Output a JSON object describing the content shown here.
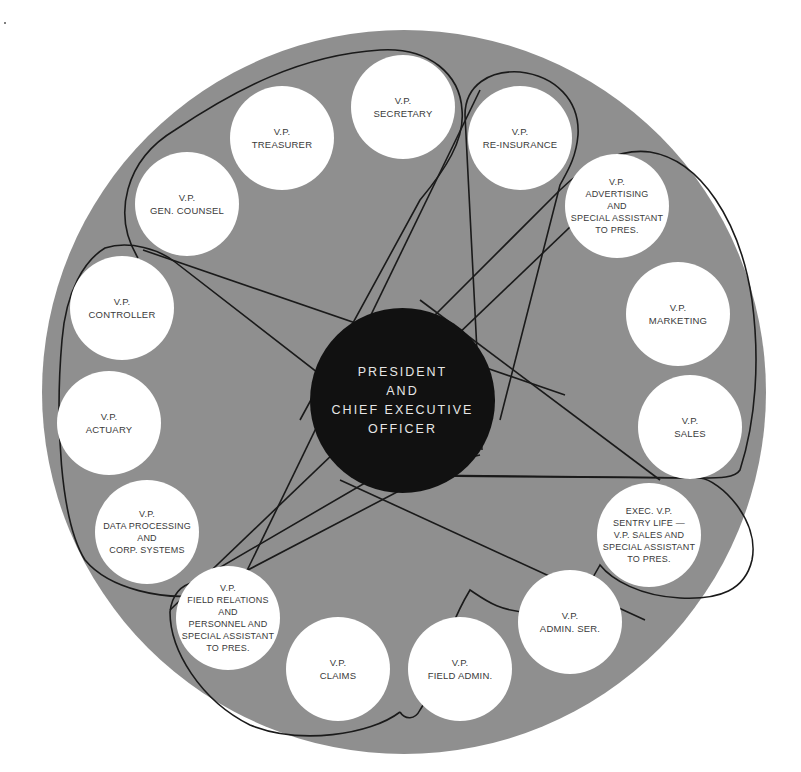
{
  "diagram": {
    "type": "circular organization chart",
    "colors": {
      "background": "#ffffff",
      "disk": "#8f8f8f",
      "vp_node": "#ffffff",
      "vp_text": "#3a3a3a",
      "center_node": "#111111",
      "center_text": "#e6e6e6",
      "connector_line": "#1a1a1a"
    },
    "center": {
      "label": "PRESIDENT\nAND\nCHIEF EXECUTIVE\nOFFICER"
    },
    "nodes": [
      {
        "id": "secretary",
        "label": "V.P.\nSECRETARY"
      },
      {
        "id": "re-insurance",
        "label": "V.P.\nRE-INSURANCE"
      },
      {
        "id": "advertising",
        "label": "V.P.\nADVERTISING\nAND\nSPECIAL ASSISTANT\nTO PRES."
      },
      {
        "id": "marketing",
        "label": "V.P.\nMARKETING"
      },
      {
        "id": "sales",
        "label": "V.P.\nSALES"
      },
      {
        "id": "exec-vp-sentry-life",
        "label": "EXEC. V.P.\nSENTRY LIFE —\nV.P. SALES AND\nSPECIAL ASSISTANT\nTO PRES."
      },
      {
        "id": "admin-ser",
        "label": "V.P.\nADMIN. SER."
      },
      {
        "id": "field-admin",
        "label": "V.P.\nFIELD ADMIN."
      },
      {
        "id": "claims",
        "label": "V.P.\nCLAIMS"
      },
      {
        "id": "field-relations",
        "label": "V.P.\nFIELD RELATIONS\nAND\nPERSONNEL AND\nSPECIAL ASSISTANT\nTO PRES."
      },
      {
        "id": "data-processing",
        "label": "V.P.\nDATA PROCESSING\nAND\nCORP. SYSTEMS"
      },
      {
        "id": "actuary",
        "label": "V.P.\nACTUARY"
      },
      {
        "id": "controller",
        "label": "V.P.\nCONTROLLER"
      },
      {
        "id": "gen-counsel",
        "label": "V.P.\nGEN. COUNSEL"
      },
      {
        "id": "treasurer",
        "label": "V.P.\nTREASURER"
      }
    ],
    "groups": [
      {
        "name": "top-group",
        "members": [
          "gen-counsel",
          "treasurer",
          "secretary"
        ]
      },
      {
        "name": "re-insurance-group",
        "members": [
          "re-insurance"
        ]
      },
      {
        "name": "right-group",
        "members": [
          "advertising",
          "marketing",
          "sales"
        ]
      },
      {
        "name": "lower-right-group",
        "members": [
          "exec-vp-sentry-life",
          "admin-ser",
          "field-admin"
        ]
      },
      {
        "name": "lower-left-group",
        "members": [
          "field-relations",
          "claims"
        ]
      },
      {
        "name": "left-group",
        "members": [
          "controller",
          "actuary",
          "data-processing"
        ]
      }
    ]
  }
}
